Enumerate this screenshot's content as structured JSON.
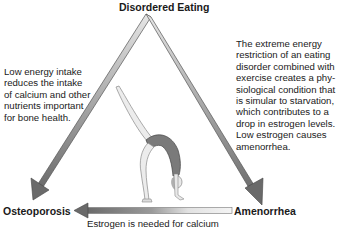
{
  "diagram": {
    "type": "female-athlete-triad",
    "nodes": {
      "top": "Disordered Eating",
      "bottom_left": "Osteoporosis",
      "bottom_right": "Amenorrhea"
    },
    "descriptions": {
      "left": [
        "Low energy intake",
        "reduces the intake",
        "of calcium and other",
        "nutrients important",
        "for bone health."
      ],
      "right": [
        "The extreme energy",
        "restriction of an eating",
        "disorder combined with",
        "exercise creates a phy-",
        "siological condition that",
        "is simular to starvation,",
        "which contributes to a",
        "drop in estrogen levels.",
        "Low estrogen causes",
        "amenorrhea."
      ]
    },
    "bottom_caption": "Estrogen is needed for calcium",
    "edges": [
      {
        "from": "Disordered Eating",
        "to": "Osteoporosis",
        "icon": "arrow-down-left-icon"
      },
      {
        "from": "Disordered Eating",
        "to": "Amenorrhea",
        "icon": "arrow-down-right-icon"
      },
      {
        "from": "Amenorrhea",
        "to": "Osteoporosis",
        "icon": "arrow-left-icon"
      }
    ],
    "center_image": "gymnast-backbend-illustration",
    "colors": {
      "arrow_dark": "#6b6b6b",
      "arrow_light": "#d8d8d8",
      "text": "#1a1a1a",
      "background": "#ffffff"
    }
  }
}
